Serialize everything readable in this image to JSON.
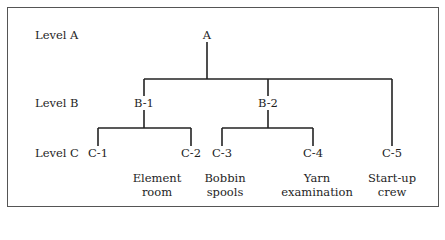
{
  "levels": [
    "Level A",
    "Level B",
    "Level C"
  ],
  "nodes": {
    "A": {
      "label": "A"
    },
    "B1": {
      "label": "B-1"
    },
    "B2": {
      "label": "B-2"
    },
    "C1": {
      "label": "C-1",
      "desc": ""
    },
    "C2": {
      "label": "C-2",
      "desc": "Element room"
    },
    "C3": {
      "label": "C-3",
      "desc": "Bobbin spools"
    },
    "C4": {
      "label": "C-4",
      "desc": "Yarn examination"
    },
    "C5": {
      "label": "C-5",
      "desc": "Start-up crew"
    }
  },
  "desc_lines": {
    "C2": [
      "Element",
      "room"
    ],
    "C3": [
      "Bobbin",
      "spools"
    ],
    "C4": [
      "Yarn",
      "examination"
    ],
    "C5": [
      "Start-up",
      "crew"
    ]
  },
  "edges": [
    [
      "A",
      "B1"
    ],
    [
      "A",
      "B2"
    ],
    [
      "A",
      "C5"
    ],
    [
      "B1",
      "C1"
    ],
    [
      "B1",
      "C2"
    ],
    [
      "B2",
      "C3"
    ],
    [
      "B2",
      "C4"
    ]
  ]
}
